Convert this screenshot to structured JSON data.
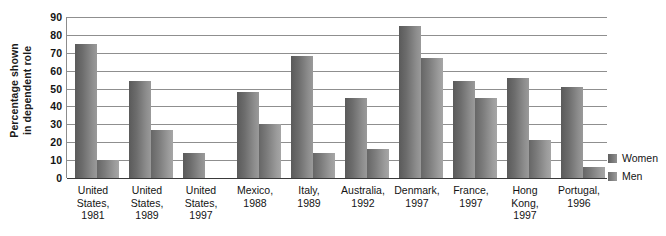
{
  "chart_data": {
    "type": "bar",
    "title": "",
    "xlabel": "",
    "ylabel": "Percentage shown in dependent role",
    "ylabel_lines": [
      "Percentage shown",
      "in dependent role"
    ],
    "ylim": [
      0,
      90
    ],
    "yticks": [
      0,
      10,
      20,
      30,
      40,
      50,
      60,
      70,
      80,
      90
    ],
    "grid": true,
    "legend_position": "right",
    "categories": [
      "United States, 1981",
      "United States, 1989",
      "United States, 1997",
      "Mexico, 1988",
      "Italy, 1989",
      "Australia, 1992",
      "Denmark, 1997",
      "France, 1997",
      "Hong Kong, 1997",
      "Portugal, 1996"
    ],
    "category_lines": [
      [
        "United",
        "States,",
        "1981"
      ],
      [
        "United",
        "States,",
        "1989"
      ],
      [
        "United",
        "States,",
        "1997"
      ],
      [
        "Mexico,",
        "1988"
      ],
      [
        "Italy,",
        "1989"
      ],
      [
        "Australia,",
        "1992"
      ],
      [
        "Denmark,",
        "1997"
      ],
      [
        "France,",
        "1997"
      ],
      [
        "Hong",
        "Kong,",
        "1997"
      ],
      [
        "Portugal,",
        "1996"
      ]
    ],
    "series": [
      {
        "name": "Women",
        "color": "#6d6d6d",
        "values": [
          75,
          54,
          14,
          48,
          68,
          45,
          85,
          54,
          56,
          51
        ]
      },
      {
        "name": "Men",
        "color": "#8a8a8a",
        "values": [
          10,
          27,
          0,
          30,
          14,
          16,
          67,
          45,
          21,
          6
        ]
      }
    ]
  },
  "legend": {
    "items": [
      {
        "label": "Women",
        "swatch": "women-swatch"
      },
      {
        "label": "Men",
        "swatch": "men-swatch"
      }
    ]
  }
}
